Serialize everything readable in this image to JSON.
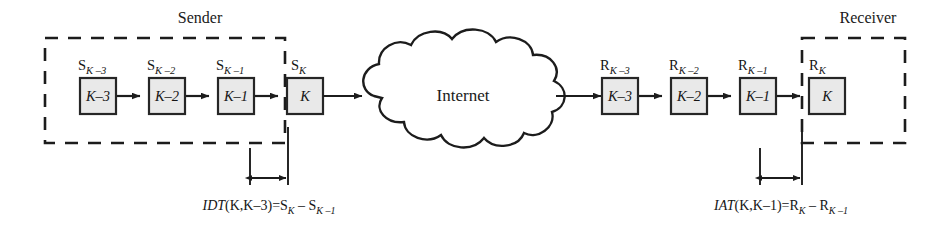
{
  "figure": {
    "type": "network-timing-diagram",
    "width": 943,
    "height": 231,
    "background_color": "#ffffff",
    "line_color": "#1c1c1c",
    "box_fill_color": "#e9e9e9",
    "box_border_color": "#262626"
  },
  "sender": {
    "title": "Sender",
    "boundary_style": "dashed",
    "packets": [
      {
        "box_label": "K–3",
        "tag_base": "S",
        "tag_sub": "K –3"
      },
      {
        "box_label": "K–2",
        "tag_base": "S",
        "tag_sub": "K –2"
      },
      {
        "box_label": "K–1",
        "tag_base": "S",
        "tag_sub": "K –1"
      },
      {
        "box_label": "K",
        "tag_base": "S",
        "tag_sub": "K"
      }
    ]
  },
  "network": {
    "label": "Internet",
    "shape": "cloud"
  },
  "receiver": {
    "title": "Receiver",
    "boundary_style": "dashed",
    "packets": [
      {
        "box_label": "K–3",
        "tag_base": "R",
        "tag_sub": "K –3"
      },
      {
        "box_label": "K–2",
        "tag_base": "R",
        "tag_sub": "K –2"
      },
      {
        "box_label": "K–1",
        "tag_base": "R",
        "tag_sub": "K –1"
      },
      {
        "box_label": "K",
        "tag_base": "R",
        "tag_sub": "K"
      }
    ]
  },
  "measurements": [
    {
      "id": "idt",
      "side": "sender",
      "acronym": "IDT",
      "args": "(K,K–3)",
      "equals": "=",
      "rhs_first_base": "S",
      "rhs_first_sub": "K",
      "minus": "–",
      "rhs_second_base": "S",
      "rhs_second_sub": "K –1",
      "full_text": "IDT(K,K–3)=S_K – S_K–1"
    },
    {
      "id": "iat",
      "side": "receiver",
      "acronym": "IAT",
      "args": "(K,K–1)",
      "equals": "=",
      "rhs_first_base": "R",
      "rhs_first_sub": "K",
      "minus": "–",
      "rhs_second_base": "R",
      "rhs_second_sub": "K –1",
      "full_text": "IAT(K,K–1)=R_K – R_K–1"
    }
  ]
}
